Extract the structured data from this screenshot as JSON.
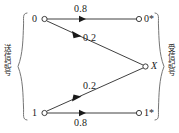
{
  "figure": {
    "type": "channel-transition-diagram",
    "title": "",
    "groups": {
      "left_label": "送信記号",
      "right_label": "受信記号"
    },
    "input_nodes": [
      {
        "id": "in-0",
        "label": "0",
        "x": 39,
        "y": 19
      },
      {
        "id": "in-1",
        "label": "1",
        "x": 39,
        "y": 113
      }
    ],
    "output_nodes": [
      {
        "id": "out-0star",
        "label": "0*",
        "x": 140,
        "y": 19
      },
      {
        "id": "out-X",
        "label": "X",
        "x": 148,
        "y": 66
      },
      {
        "id": "out-1star",
        "label": "1*",
        "x": 140,
        "y": 113
      }
    ],
    "edges": [
      {
        "from": "0",
        "to": "0*",
        "probability": "0.8",
        "label_x": 74,
        "label_y": 3
      },
      {
        "from": "0",
        "to": "X",
        "probability": "0.2",
        "label_x": 83,
        "label_y": 32
      },
      {
        "from": "1",
        "to": "X",
        "probability": "0.2",
        "label_x": 83,
        "label_y": 80
      },
      {
        "from": "1",
        "to": "1*",
        "probability": "0.8",
        "label_x": 74,
        "label_y": 117
      }
    ],
    "colors": {
      "stroke": "#2a2a2a",
      "text": "#1a1a1a",
      "node_fill": "#ffffff",
      "background": "#ffffff"
    }
  }
}
